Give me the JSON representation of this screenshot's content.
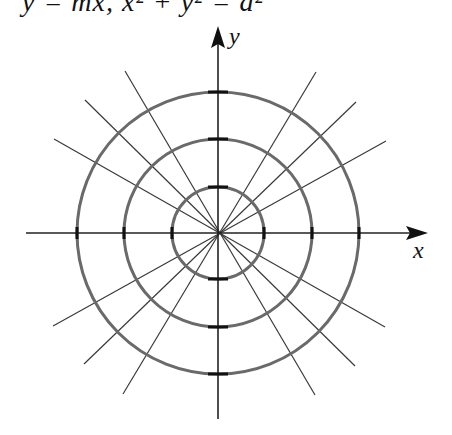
{
  "header": {
    "equation": "y = mx, x² + y² = a²"
  },
  "axes": {
    "x_label": "x",
    "y_label": "y"
  },
  "diagram": {
    "center": [
      218,
      233
    ],
    "circle_radii": [
      46,
      94,
      141
    ],
    "line_angles_deg": [
      30,
      45,
      60,
      120,
      135,
      150
    ],
    "colors": {
      "circle": "#6a6a6a",
      "line": "#3a3a3a",
      "axis": "#222222"
    }
  }
}
